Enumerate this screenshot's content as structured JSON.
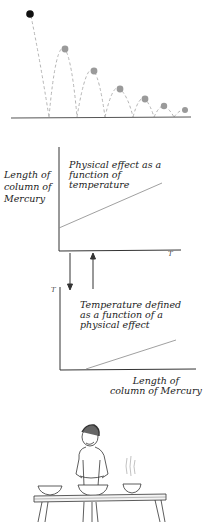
{
  "figure": {
    "bouncing_ball": {
      "description": "Ball bouncing with decreasing height",
      "start_ball_color": "#111111",
      "ball_color": "#9a9a9a",
      "path_style": "dashed"
    },
    "graph_top": {
      "y_axis_label": [
        "Length of",
        "column of",
        "Mercury"
      ],
      "x_axis_label": "T",
      "caption": [
        "Physical effect as a",
        "function of",
        "temperature"
      ]
    },
    "arrows": {
      "down": "arrow-down",
      "up": "arrow-up"
    },
    "graph_bottom": {
      "y_axis_label": "T",
      "x_axis_label": [
        "Length of",
        "column of Mercury"
      ],
      "caption": [
        "Temperature defined",
        "as a function of a",
        "physical effect"
      ]
    },
    "illustration": {
      "description": "Boy standing behind a table with three bowls, one steaming"
    }
  }
}
